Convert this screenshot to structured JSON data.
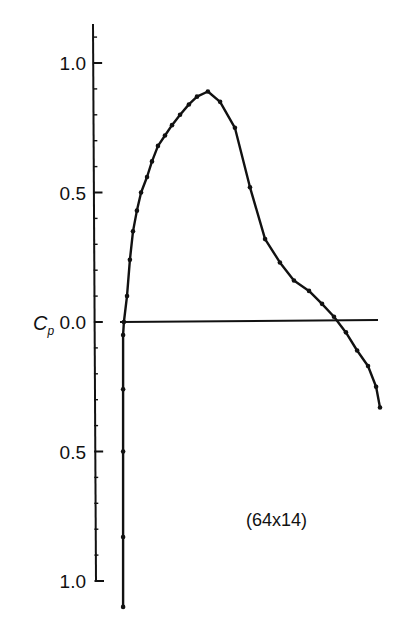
{
  "chart_data": {
    "type": "line",
    "title": "",
    "xlabel": "",
    "ylabel": "Cp",
    "ylabel_main": "C",
    "ylabel_sub": "p",
    "annotation": "(64x14)",
    "ylim": [
      -1.15,
      1.15
    ],
    "y_axis_inverted_labels": true,
    "y_ticks": [
      {
        "value": 1.0,
        "label": "1.0"
      },
      {
        "value": 0.5,
        "label": "0.5"
      },
      {
        "value": 0.0,
        "label": "0.0"
      },
      {
        "value": -0.5,
        "label": "0.5"
      },
      {
        "value": -1.0,
        "label": "1.0"
      }
    ],
    "grid": false,
    "legend": null,
    "baseline": {
      "y": 0.0,
      "x_start": 0.0,
      "x_end": 1.0
    },
    "series": [
      {
        "name": "Cp distribution",
        "x": [
          0.012,
          0.012,
          0.012,
          0.012,
          0.012,
          0.015,
          0.027,
          0.038,
          0.05,
          0.065,
          0.081,
          0.104,
          0.123,
          0.146,
          0.173,
          0.2,
          0.231,
          0.265,
          0.296,
          0.338,
          0.385,
          0.442,
          0.5,
          0.558,
          0.615,
          0.669,
          0.727,
          0.777,
          0.823,
          0.869,
          0.912,
          0.954,
          0.985,
          1.0
        ],
        "y": [
          -1.1,
          -0.83,
          -0.5,
          -0.26,
          -0.05,
          0.0,
          0.1,
          0.24,
          0.35,
          0.43,
          0.5,
          0.56,
          0.62,
          0.68,
          0.72,
          0.76,
          0.8,
          0.84,
          0.87,
          0.89,
          0.85,
          0.75,
          0.52,
          0.32,
          0.23,
          0.16,
          0.12,
          0.07,
          0.02,
          -0.04,
          -0.11,
          -0.17,
          -0.25,
          -0.33
        ]
      }
    ]
  }
}
